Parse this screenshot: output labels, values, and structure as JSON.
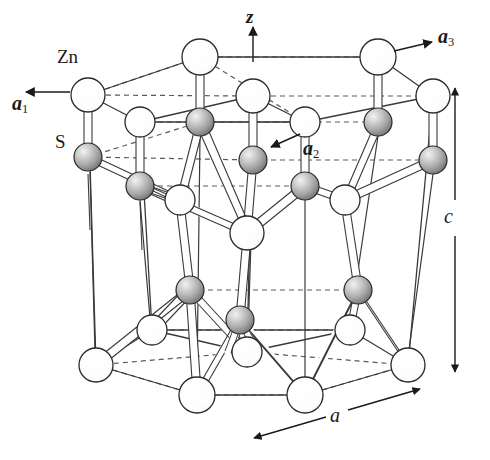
{
  "figure": {
    "background_color": "#ffffff",
    "width": 490,
    "height": 460
  },
  "labels": {
    "zn": "Zn",
    "s": "S",
    "axis_z": "z",
    "vector_a1": "a",
    "vector_a1_sub": "1",
    "vector_a2": "a",
    "vector_a2_sub": "2",
    "vector_a3": "a",
    "vector_a3_sub": "3",
    "dim_c": "c",
    "dim_a": "a"
  },
  "colors": {
    "zn_fill": "#ffffff",
    "zn_stroke": "#2a2a2a",
    "s_fill_highlight": "#f0f0f0",
    "s_fill_mid": "#b8b8b8",
    "s_fill_edge": "#6e6e6e",
    "s_stroke": "#2a2a2a",
    "bond_fill": "#ffffff",
    "bond_stroke": "#3a3a3a",
    "cell_edge": "#3a3a3a",
    "cell_edge_hidden": "#5a5a5a",
    "label_color": "#1a1a1a"
  },
  "geometry": {
    "atom_radius_zn": 17,
    "atom_radius_s": 14,
    "bond_half_width": 3.2,
    "hidden_line_dash": "5,4"
  },
  "atoms": {
    "zn_top_ring": [
      {
        "id": "zn-t-left",
        "x": 88,
        "y": 95,
        "r": 17
      },
      {
        "id": "zn-t-backleft",
        "x": 200,
        "y": 57,
        "r": 18
      },
      {
        "id": "zn-t-backright",
        "x": 378,
        "y": 57,
        "r": 18
      },
      {
        "id": "zn-t-frontmid",
        "x": 253,
        "y": 96,
        "r": 17
      },
      {
        "id": "zn-t-right",
        "x": 433,
        "y": 96,
        "r": 17
      },
      {
        "id": "zn-t-innerleft",
        "x": 140,
        "y": 122,
        "r": 15
      },
      {
        "id": "zn-t-innerright",
        "x": 305,
        "y": 122,
        "r": 15
      }
    ],
    "s_upper": [
      {
        "id": "s-u-left",
        "x": 88,
        "y": 157,
        "r": 14
      },
      {
        "id": "s-u-mid",
        "x": 200,
        "y": 122,
        "r": 14
      },
      {
        "id": "s-u-right",
        "x": 378,
        "y": 122,
        "r": 14
      },
      {
        "id": "s-u-front",
        "x": 253,
        "y": 160,
        "r": 14
      },
      {
        "id": "s-u-far",
        "x": 433,
        "y": 160,
        "r": 14
      },
      {
        "id": "s-u-deep1",
        "x": 140,
        "y": 186,
        "r": 14
      },
      {
        "id": "s-u-deep2",
        "x": 305,
        "y": 186,
        "r": 14
      }
    ],
    "zn_mid": [
      {
        "id": "zn-m-left",
        "x": 180,
        "y": 200,
        "r": 15
      },
      {
        "id": "zn-m-mid",
        "x": 247,
        "y": 233,
        "r": 17
      },
      {
        "id": "zn-m-right",
        "x": 345,
        "y": 200,
        "r": 15
      }
    ],
    "s_lower": [
      {
        "id": "s-l-left",
        "x": 190,
        "y": 290,
        "r": 14
      },
      {
        "id": "s-l-mid",
        "x": 240,
        "y": 320,
        "r": 14
      },
      {
        "id": "s-l-right",
        "x": 358,
        "y": 290,
        "r": 14
      }
    ],
    "zn_bottom_ring": [
      {
        "id": "zn-b-left",
        "x": 96,
        "y": 365,
        "r": 17
      },
      {
        "id": "zn-b-frontleft",
        "x": 197,
        "y": 395,
        "r": 18
      },
      {
        "id": "zn-b-frontright",
        "x": 305,
        "y": 395,
        "r": 18
      },
      {
        "id": "zn-b-right",
        "x": 408,
        "y": 365,
        "r": 17
      },
      {
        "id": "zn-b-innermid",
        "x": 247,
        "y": 352,
        "r": 15
      },
      {
        "id": "zn-b-innerleft",
        "x": 152,
        "y": 330,
        "r": 15
      },
      {
        "id": "zn-b-innerright",
        "x": 350,
        "y": 330,
        "r": 15
      }
    ]
  },
  "annotations": {
    "z_axis": {
      "from_x": 253,
      "from_y": 62,
      "to_x": 253,
      "to_y": 26,
      "label_x": 246,
      "label_y": 10
    },
    "a1_arrow": {
      "from_x": 68,
      "from_y": 92,
      "to_x": 22,
      "to_y": 92,
      "label_x": 16,
      "label_y": 100
    },
    "a2_arrow": {
      "from_x": 299,
      "from_y": 133,
      "to_x": 268,
      "to_y": 148,
      "label_x": 301,
      "label_y": 140
    },
    "a3_arrow": {
      "from_x": 396,
      "from_y": 50,
      "to_x": 434,
      "to_y": 41,
      "label_x": 440,
      "label_y": 30
    },
    "c_dim": {
      "x": 453,
      "top_y": 84,
      "bottom_y": 372,
      "label_x": 440,
      "label_y": 218
    },
    "a_dim": {
      "from_x": 310,
      "from_y": 421,
      "to_x": 420,
      "to_y": 390,
      "label_x": 360,
      "label_y": 408
    }
  }
}
